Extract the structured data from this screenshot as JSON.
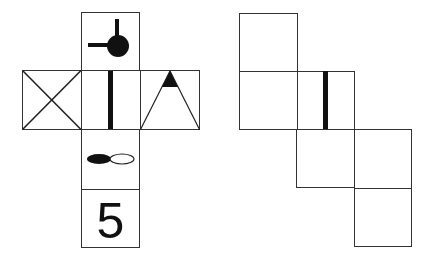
{
  "figure": {
    "left_net": {
      "faces": [
        {
          "id": "top",
          "symbol": "circle-with-two-sticks",
          "x": 81,
          "y": 12,
          "size": 58
        },
        {
          "id": "left",
          "symbol": "x-cross",
          "x": 22,
          "y": 70,
          "size": 59
        },
        {
          "id": "center",
          "symbol": "vertical-bar",
          "x": 81,
          "y": 70,
          "size": 59
        },
        {
          "id": "right",
          "symbol": "triangle-black-apex",
          "x": 140,
          "y": 70,
          "size": 59
        },
        {
          "id": "below-center",
          "symbol": "ovals-filled-hollow",
          "x": 81,
          "y": 129,
          "size": 60
        },
        {
          "id": "bottom",
          "symbol": "digit",
          "text": "5",
          "x": 81,
          "y": 189,
          "size": 58
        }
      ]
    },
    "right_net": {
      "faces": [
        {
          "id": "r1",
          "symbol": "blank",
          "x": 239,
          "y": 13,
          "size": 58
        },
        {
          "id": "r2",
          "symbol": "blank",
          "x": 239,
          "y": 71,
          "size": 58
        },
        {
          "id": "r3",
          "symbol": "vertical-bar",
          "x": 297,
          "y": 71,
          "size": 58
        },
        {
          "id": "r4",
          "symbol": "blank",
          "x": 297,
          "y": 129,
          "size": 58
        },
        {
          "id": "r5",
          "symbol": "blank",
          "x": 354,
          "y": 129,
          "size": 58
        },
        {
          "id": "r6",
          "symbol": "blank",
          "x": 354,
          "y": 187,
          "size": 58
        }
      ]
    },
    "digit_label": "5",
    "colors": {
      "stroke": "#333333",
      "fill": "#111111",
      "background": "#ffffff"
    }
  }
}
